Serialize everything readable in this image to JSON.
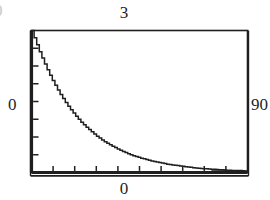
{
  "figure": {
    "background_color": "#ffffff",
    "ink_color": "#1f1f1f",
    "edge_glyph": "0"
  },
  "labels": {
    "top": "3",
    "left": "0",
    "right": "90",
    "bottom": "0"
  },
  "chart_data": {
    "type": "line",
    "title": "",
    "subtitle": "",
    "xlabel": "",
    "ylabel": "",
    "grid": false,
    "legend": null,
    "frame": true,
    "axis_labels": {
      "top": "3",
      "left": "0",
      "right": "90",
      "bottom": "0"
    },
    "xlim": [
      0,
      90
    ],
    "ylim": [
      0,
      3
    ],
    "x_tick_count": 9,
    "y_tick_count": 7,
    "x_ticks": [
      0,
      10,
      20,
      30,
      40,
      50,
      60,
      70,
      80,
      90
    ],
    "y_ticks": [
      0,
      0.5,
      1.0,
      1.5,
      2.0,
      2.5,
      3.0
    ],
    "series": [
      {
        "name": "decay",
        "x": [
          0,
          3,
          6,
          9,
          12,
          15,
          18,
          21,
          24,
          27,
          30,
          33,
          36,
          39,
          42,
          45,
          48,
          51,
          54,
          57,
          60,
          63,
          66,
          69,
          72,
          75,
          78,
          81,
          84,
          87,
          90
        ],
        "y": [
          3.0,
          2.58,
          2.22,
          1.91,
          1.64,
          1.41,
          1.21,
          1.04,
          0.9,
          0.77,
          0.66,
          0.57,
          0.49,
          0.42,
          0.36,
          0.31,
          0.27,
          0.23,
          0.2,
          0.17,
          0.15,
          0.13,
          0.11,
          0.09,
          0.08,
          0.07,
          0.06,
          0.05,
          0.04,
          0.04,
          0.03
        ]
      }
    ]
  }
}
